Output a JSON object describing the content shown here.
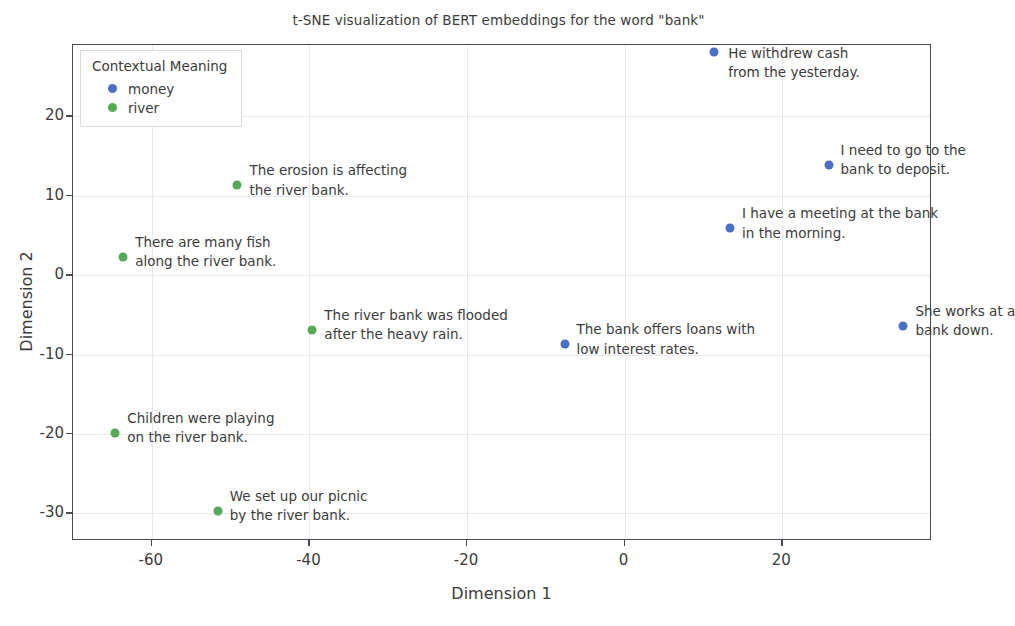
{
  "chart_data": {
    "type": "scatter",
    "title": "t-SNE visualization of BERT embeddings for the word \"bank\"",
    "xlabel": "Dimension 1",
    "ylabel": "Dimension 2",
    "xlim": [
      -70,
      39
    ],
    "ylim": [
      -33.5,
      29
    ],
    "xticks": [
      -60,
      -40,
      -20,
      0,
      20
    ],
    "yticks": [
      20,
      10,
      0,
      -10,
      -20,
      -30
    ],
    "xticklabels": [
      "-60",
      "-40",
      "-20",
      "0",
      "20"
    ],
    "yticklabels": [
      "20",
      "10",
      "0",
      "-10",
      "-20",
      "-30"
    ],
    "grid": true,
    "legend": {
      "title": "Contextual Meaning",
      "position": "upper-left",
      "entries": [
        {
          "label": "money",
          "color": "#4a6fc4"
        },
        {
          "label": "river",
          "color": "#55aa55"
        }
      ]
    },
    "series": [
      {
        "name": "money",
        "color": "#4a6fc4",
        "points": [
          {
            "x": 11.5,
            "y": 28.0,
            "text": "He withdrew cash\nfrom the yesterday.",
            "label_dx": 14,
            "label_dy": -8
          },
          {
            "x": 26.0,
            "y": 13.8,
            "text": "I need to go to the\nbank to deposit.",
            "label_dx": 12,
            "label_dy": -24
          },
          {
            "x": 13.5,
            "y": 5.8,
            "text": "I have a meeting at the bank\nin the morning.",
            "label_dx": 12,
            "label_dy": -24
          },
          {
            "x": -7.5,
            "y": -8.8,
            "text": "The bank offers loans with\nlow interest rates.",
            "label_dx": 12,
            "label_dy": -24
          },
          {
            "x": 35.5,
            "y": -6.5,
            "text": "She works at a\nbank down.",
            "label_dx": 12,
            "label_dy": -24
          }
        ]
      },
      {
        "name": "river",
        "color": "#55aa55",
        "points": [
          {
            "x": -49.0,
            "y": 11.2,
            "text": "The erosion is affecting\nthe river bank.",
            "label_dx": 12,
            "label_dy": -24
          },
          {
            "x": -63.5,
            "y": 2.2,
            "text": "There are many fish\nalong the river bank.",
            "label_dx": 12,
            "label_dy": -24
          },
          {
            "x": -39.5,
            "y": -7.0,
            "text": "The river bank was flooded\nafter the heavy rain.",
            "label_dx": 12,
            "label_dy": -24
          },
          {
            "x": -64.5,
            "y": -20.0,
            "text": "Children were playing\non the river bank.",
            "label_dx": 12,
            "label_dy": -24
          },
          {
            "x": -51.5,
            "y": -29.8,
            "text": "We set up our picnic\nby the river bank.",
            "label_dx": 12,
            "label_dy": -24
          }
        ]
      }
    ]
  }
}
